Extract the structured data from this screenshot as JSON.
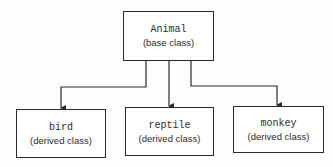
{
  "diagram": {
    "type": "class-hierarchy",
    "root": {
      "name": "Animal",
      "kind": "(base class)"
    },
    "children": [
      {
        "name": "bird",
        "kind": "(derived class)"
      },
      {
        "name": "reptile",
        "kind": "(derived class)"
      },
      {
        "name": "monkey",
        "kind": "(derived class)"
      }
    ],
    "edges": [
      {
        "from": "Animal",
        "to": "bird"
      },
      {
        "from": "Animal",
        "to": "reptile"
      },
      {
        "from": "Animal",
        "to": "monkey"
      }
    ],
    "colors": {
      "line": "#2a2a2a",
      "text": "#2b2b2b",
      "background": "#fdfdfd"
    }
  }
}
